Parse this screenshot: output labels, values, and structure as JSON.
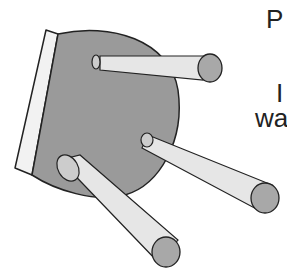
{
  "image": {
    "subject": "upside-down three-legged stool",
    "colors": {
      "seat_top": "#9a9a9a",
      "seat_edge": "#f2f2f2",
      "leg": "#e6e6e6",
      "leg_end": "#a8a8a8",
      "outline": "#222222",
      "background": "#ffffff"
    }
  },
  "text_fragments": {
    "line1": "P",
    "line2": "I",
    "line3": "wa"
  }
}
